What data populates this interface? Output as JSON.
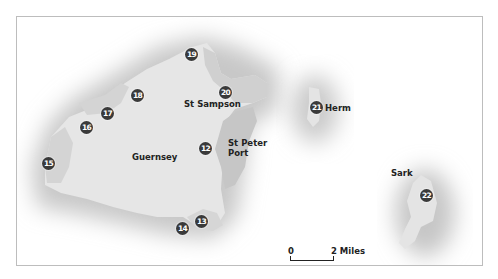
{
  "map": {
    "colors": {
      "background": "#ffffff",
      "land": "#e6e6e6",
      "town_shade": "#c9c9c9",
      "bay_shade": "#d3d3d3",
      "halo": "#c4c4c4",
      "marker": "#3a3a3a",
      "label": "#222222",
      "border": "#bdbdbd"
    },
    "islands": [
      {
        "name": "Guernsey",
        "label": "Guernsey"
      },
      {
        "name": "Herm",
        "label": "Herm"
      },
      {
        "name": "Sark",
        "label": "Sark"
      }
    ],
    "places": [
      {
        "label": "St Sampson"
      },
      {
        "label_line1": "St Peter",
        "label_line2": "Port"
      }
    ],
    "markers": [
      {
        "number": "12"
      },
      {
        "number": "13"
      },
      {
        "number": "14"
      },
      {
        "number": "15"
      },
      {
        "number": "16"
      },
      {
        "number": "17"
      },
      {
        "number": "18"
      },
      {
        "number": "19"
      },
      {
        "number": "20"
      },
      {
        "number": "21"
      },
      {
        "number": "22"
      }
    ],
    "scale": {
      "start_label": "0",
      "end_label": "2 Miles"
    }
  }
}
